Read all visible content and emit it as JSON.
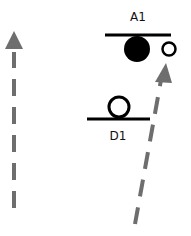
{
  "diagram": {
    "labels": {
      "a1": "A1",
      "d1": "D1"
    },
    "colors": {
      "arrow": "#6e6e6e",
      "stroke": "#000000",
      "background": "#ffffff"
    }
  }
}
